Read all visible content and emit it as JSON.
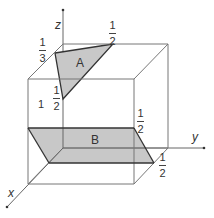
{
  "diagram": {
    "axes": {
      "x": "x",
      "y": "y",
      "z": "z"
    },
    "cube_edge_label": "1",
    "planes": [
      {
        "name": "A",
        "intercepts": {
          "x": "1/2",
          "y": "1/2",
          "z": "1/3"
        }
      },
      {
        "name": "B",
        "intercepts": {
          "x": "1/2",
          "z": "1/2"
        }
      }
    ],
    "labels": {
      "plane_a": "A",
      "plane_b": "B",
      "frac_top_y": {
        "num": "1",
        "den": "2"
      },
      "frac_top_z": {
        "num": "1",
        "den": "3"
      },
      "frac_x_a": {
        "num": "1",
        "den": "2"
      },
      "frac_z_b": {
        "num": "1",
        "den": "2"
      },
      "frac_x_b": {
        "num": "1",
        "den": "2"
      }
    },
    "colors": {
      "line": "#555555",
      "fill": "#c8c8c8",
      "edge": "#333333"
    }
  }
}
